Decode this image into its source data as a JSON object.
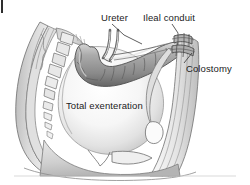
{
  "figure": {
    "kind": "medical-line-illustration",
    "palette": {
      "background": "#ffffff",
      "label_text": "#1b1b1b",
      "outline": "#5a5a5a",
      "outline_dark": "#3c3c3c",
      "body_wall_light": "#efefef",
      "body_wall_mid": "#c9c9c9",
      "body_wall_shadow": "#9a9a9a",
      "cavity_highlight": "#fdfdfd",
      "cavity_shade": "#d7d7d7",
      "bowel_mid": "#a6a6a6",
      "bowel_dark": "#6f6f6f",
      "bowel_highlight": "#e2e2e2",
      "vertebra_fill": "#e6e6e6",
      "leader_line": "#333333"
    }
  },
  "labels": {
    "ureter": "Ureter",
    "ileal_conduit": "Ileal conduit",
    "colostomy": "Colostomy",
    "total_exenteration": "Total exenteration"
  },
  "structures": [
    {
      "name": "sacrum-vertebral-column",
      "description": "Stacked vertebral bodies along left posterior pelvic wall"
    },
    {
      "name": "pelvic-cavity",
      "description": "Large pale dome representing the emptied pelvis after total exenteration"
    },
    {
      "name": "ileal-conduit-loop",
      "description": "Segmented bowel loop arching across the upper abdomen"
    },
    {
      "name": "ureter-left",
      "description": "Thin tubular ureter descending to the conduit"
    },
    {
      "name": "ureter-right",
      "description": "Thin tubular ureter descending to the conduit"
    },
    {
      "name": "abdominal-wall",
      "description": "Vertical anterior abdominal wall band on the right"
    },
    {
      "name": "ileal-conduit-stoma",
      "description": "Stoma where the conduit exits the abdominal wall"
    },
    {
      "name": "colostomy-stoma",
      "description": "Stoma where the colon exits the abdominal wall"
    },
    {
      "name": "pelvic-floor",
      "description": "Lower soft tissue and perineal contour"
    }
  ],
  "leader_lines": [
    {
      "from": "ureter-label",
      "to": "ureter-tube"
    },
    {
      "from": "ileal-conduit-label",
      "to": "conduit-stoma"
    },
    {
      "from": "colostomy-label",
      "to": "colostomy-stoma"
    }
  ]
}
